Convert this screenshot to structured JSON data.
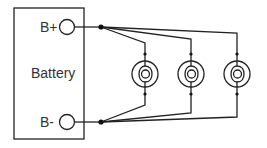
{
  "diagram": {
    "battery": {
      "label": "Battery",
      "positive_terminal": "B+",
      "negative_terminal": "B-"
    },
    "lamps": [
      {
        "id": "lamp-1",
        "icon": "lamp-icon"
      },
      {
        "id": "lamp-2",
        "icon": "lamp-icon"
      },
      {
        "id": "lamp-3",
        "icon": "lamp-icon"
      }
    ],
    "colors": {
      "line": "#222222",
      "text": "#333333",
      "background": "#ffffff"
    }
  }
}
